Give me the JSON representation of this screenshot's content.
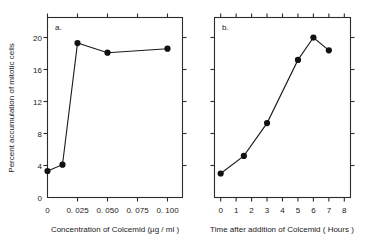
{
  "figure": {
    "background": "#ffffff",
    "ink": "#1a1a1a",
    "shared_ylabel": "Percent accumulation of mitotic cells",
    "y_ticks": [
      0,
      4,
      8,
      12,
      16,
      20
    ],
    "y_tick_labels": [
      "0",
      "4",
      "8",
      "12",
      "16",
      "20"
    ],
    "ylim": [
      0,
      22.5
    ]
  },
  "chart_data": [
    {
      "type": "line",
      "panel": "a",
      "panel_label": "a.",
      "title": "",
      "xlabel": "Concentration  of  Colcemid  (µg / ml )",
      "ylabel": "Percent accumulation of mitotic cells",
      "x": [
        0,
        0.0125,
        0.025,
        0.05,
        0.1
      ],
      "values": [
        3.3,
        4.1,
        19.3,
        18.1,
        18.6
      ],
      "x_ticks": [
        0,
        0.025,
        0.05,
        0.075,
        0.1
      ],
      "x_tick_labels": [
        "0",
        "0. 025",
        "0. 050",
        "0. 075",
        "0. 100"
      ],
      "xlim": [
        0,
        0.1125
      ],
      "ylim": [
        0,
        22.5
      ],
      "grid": false,
      "legend": "none",
      "marker": "filled-circle"
    },
    {
      "type": "line",
      "panel": "b",
      "panel_label": "b.",
      "title": "",
      "xlabel": "Time  after  addition of Colcemid ( Hours )",
      "ylabel": "Percent accumulation of mitotic cells",
      "x": [
        0,
        1.5,
        3,
        5,
        6,
        7
      ],
      "values": [
        3.0,
        5.2,
        9.3,
        17.2,
        20.0,
        18.4
      ],
      "x_ticks": [
        0,
        1,
        2,
        3,
        4,
        5,
        6,
        7,
        8
      ],
      "x_tick_labels": [
        "0",
        "1",
        "2",
        "3",
        "4",
        "5",
        "6",
        "7",
        "8"
      ],
      "xlim": [
        -0.4,
        8.4
      ],
      "ylim": [
        0,
        22.5
      ],
      "grid": false,
      "legend": "none",
      "marker": "filled-circle"
    }
  ]
}
